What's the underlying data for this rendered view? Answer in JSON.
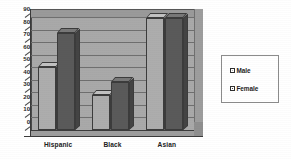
{
  "chart_data": {
    "type": "bar",
    "title": "",
    "subtitle": "",
    "xlabel": "",
    "ylabel": "",
    "categories": [
      "Hispanic",
      "Black",
      "Asian"
    ],
    "series": [
      {
        "name": "Male",
        "color": "#adadad",
        "values": [
          50,
          28,
          89
        ]
      },
      {
        "name": "Female",
        "color": "#5a5a5a",
        "values": [
          77,
          38,
          89
        ]
      }
    ],
    "ylim": [
      0,
      90
    ],
    "ytick_step": 10,
    "yticks": [
      "90",
      "80",
      "70",
      "60",
      "50",
      "40",
      "30",
      "20",
      "10",
      "0"
    ],
    "grid": true,
    "grid_axis": "y",
    "legend_position": "right",
    "style": "3d-grouped-bar",
    "background": "#ffffff",
    "plot_background": "#a9a9a9"
  },
  "legend": {
    "items": [
      {
        "label": "Male",
        "swatch": "male-swatch"
      },
      {
        "label": "Female",
        "swatch": "female-swatch"
      }
    ]
  },
  "axis": {
    "y": {
      "ticks": [
        "90",
        "80",
        "70",
        "60",
        "50",
        "40",
        "30",
        "20",
        "10",
        "0"
      ]
    },
    "x": {
      "ticks": [
        "Hispanic",
        "Black",
        "Asian"
      ]
    }
  }
}
